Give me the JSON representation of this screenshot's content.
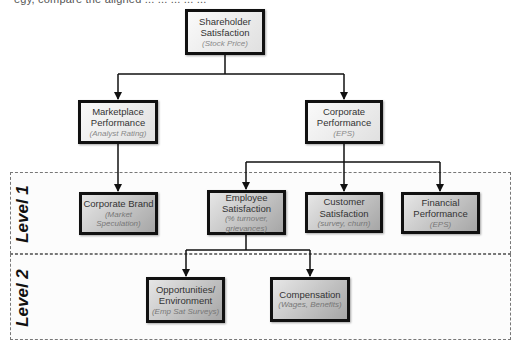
{
  "cut_header_text": "egy, compare the aligned ... ... ... ... ...",
  "levels": [
    {
      "id": "level-1",
      "label": "Level 1"
    },
    {
      "id": "level-2",
      "label": "Level 2"
    }
  ],
  "nodes": {
    "shareholder": {
      "title": "Shareholder Satisfaction",
      "sub": "(Stock Price)"
    },
    "marketplace": {
      "title": "Marketplace Performance",
      "sub": "(Analyst Rating)"
    },
    "corporate_perf": {
      "title": "Corporate Performance",
      "sub": "(EPS)"
    },
    "corporate_brand": {
      "title": "Corporate Brand",
      "sub": "(Market Speculation)"
    },
    "employee": {
      "title": "Employee Satisfaction",
      "sub": "(% turnover, grievances)"
    },
    "customer": {
      "title": "Customer Satisfaction",
      "sub": "(survey, churn)"
    },
    "financial": {
      "title": "Financial Performance",
      "sub": "(EPS)"
    },
    "opportunities": {
      "title": "Opportunities/ Environment",
      "sub": "(Emp Sat Surveys)"
    },
    "compensation": {
      "title": "Compensation",
      "sub": "(Wages, Benefits)"
    }
  },
  "edges": [
    [
      "shareholder",
      "marketplace"
    ],
    [
      "shareholder",
      "corporate_perf"
    ],
    [
      "marketplace",
      "corporate_brand"
    ],
    [
      "corporate_perf",
      "employee"
    ],
    [
      "corporate_perf",
      "customer"
    ],
    [
      "corporate_perf",
      "financial"
    ],
    [
      "employee",
      "opportunities"
    ],
    [
      "employee",
      "compensation"
    ]
  ]
}
